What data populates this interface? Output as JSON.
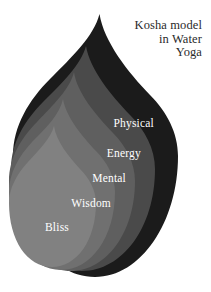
{
  "title": {
    "lines": [
      "Kosha model",
      "in Water",
      "Yoga"
    ],
    "full": "Kosha model in Water Yoga",
    "color": "#2a2a2a"
  },
  "diagram": {
    "shape": "water-drop",
    "background": "#ffffff",
    "layer_count": 5,
    "layers": [
      {
        "label": "Physical",
        "color": "#1b1b1b",
        "order": 1
      },
      {
        "label": "Energy",
        "color": "#4a4a4a",
        "order": 2
      },
      {
        "label": "Mental",
        "color": "#5f5f5f",
        "order": 3
      },
      {
        "label": "Wisdom",
        "color": "#707070",
        "order": 4
      },
      {
        "label": "Bliss",
        "color": "#818181",
        "order": 5
      }
    ],
    "label_color": "#ffffff"
  }
}
